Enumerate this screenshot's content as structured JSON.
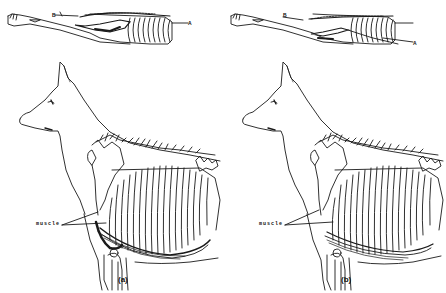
{
  "figure": {
    "panels": [
      {
        "id": "a",
        "caption": "(a)",
        "top_view_labels": {
          "B": "B",
          "A": "A"
        },
        "muscle_label": "muscle"
      },
      {
        "id": "b",
        "caption": "(b)",
        "top_view_labels": {
          "B": "B",
          "A": "A"
        },
        "muscle_label": "muscle"
      }
    ],
    "colors": {
      "line": "#1a1a1a",
      "background": "#ffffff"
    }
  }
}
